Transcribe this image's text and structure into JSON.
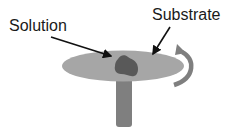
{
  "diagram": {
    "type": "spin-coating-schematic",
    "labels": {
      "solution": "Solution",
      "substrate": "Substrate"
    },
    "components": [
      {
        "name": "substrate-disc",
        "shape": "ellipse",
        "color": "#a6a6a6"
      },
      {
        "name": "solution-drop",
        "shape": "blob",
        "color": "#595959"
      },
      {
        "name": "spindle-post",
        "shape": "rectangle",
        "color": "#7f7f7f"
      },
      {
        "name": "rotation-arrow",
        "shape": "curved-arrow",
        "color": "#7f7f7f"
      }
    ],
    "pointers": [
      {
        "from_label": "Solution",
        "to": "solution-drop",
        "color": "#111111"
      },
      {
        "from_label": "Substrate",
        "to": "substrate-disc",
        "color": "#111111"
      }
    ]
  }
}
